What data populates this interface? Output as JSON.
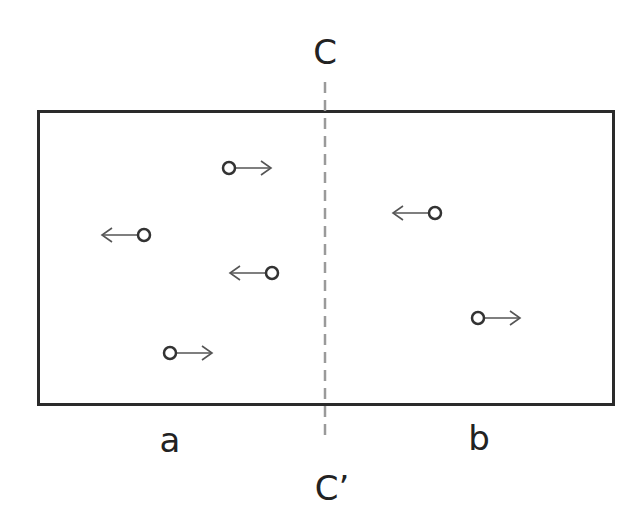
{
  "diagram": {
    "title": "",
    "divider": {
      "top_label": "C",
      "bottom_label": "C’",
      "style": "dashed",
      "color": "#9a9a9a"
    },
    "regions": [
      {
        "id": "a",
        "label": "a"
      },
      {
        "id": "b",
        "label": "b"
      }
    ],
    "box_color": "#2a2a2a",
    "particles": [
      {
        "region": "a",
        "x": 229,
        "y": 168,
        "direction": "right"
      },
      {
        "region": "a",
        "x": 144,
        "y": 235,
        "direction": "left"
      },
      {
        "region": "a",
        "x": 272,
        "y": 273,
        "direction": "left"
      },
      {
        "region": "a",
        "x": 170,
        "y": 353,
        "direction": "right"
      },
      {
        "region": "b",
        "x": 435,
        "y": 213,
        "direction": "left"
      },
      {
        "region": "b",
        "x": 478,
        "y": 318,
        "direction": "right"
      }
    ]
  }
}
